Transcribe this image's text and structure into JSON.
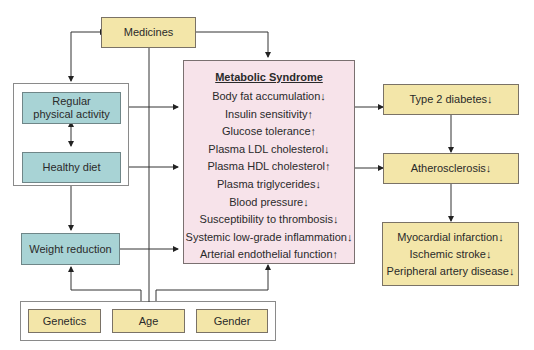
{
  "title": "Metabolic Syndrome",
  "medicines": "Medicines",
  "lifestyle": {
    "activity": "Regular physical activity",
    "diet": "Healthy diet",
    "weight": "Weight reduction"
  },
  "metabolic_syndrome": {
    "heading": "Metabolic Syndrome",
    "items": [
      "Body fat accumulation↓",
      "Insulin sensitivity↑",
      "Glucose tolerance↑",
      "Plasma LDL cholesterol↓",
      "Plasma HDL cholesterol↑",
      "Plasma triglycerides↓",
      "Blood pressure↓",
      "Susceptibility to thrombosis↓",
      "Systemic low-grade inflammation↓",
      "Arterial endothelial function↑"
    ]
  },
  "outcomes": {
    "diabetes": "Type 2 diabetes↓",
    "atherosclerosis": "Atherosclerosis↓",
    "cardiovascular": [
      "Myocardial infarction↓",
      "Ischemic stroke↓",
      "Peripheral artery disease↓"
    ]
  },
  "factors": [
    "Genetics",
    "Age",
    "Gender"
  ],
  "colors": {
    "yellow": "#f3e6a9",
    "teal": "#a8d3d5",
    "pink": "#f7e3ea"
  }
}
